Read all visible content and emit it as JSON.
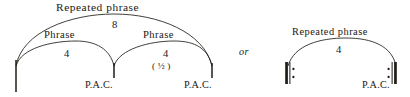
{
  "figure": {
    "kind": "music-phrase-structure-diagram",
    "separator": "or",
    "ink_color": "#201d16",
    "background_color": "#ffffff"
  },
  "diagram_a": {
    "top_bracket": {
      "label": "Repeated phrase",
      "measure_count": "8"
    },
    "phrases": [
      {
        "label": "Phrase",
        "measure_count": "4",
        "cadence": "P.A.C.",
        "annotation": ""
      },
      {
        "label": "Phrase",
        "measure_count": "4",
        "cadence": "P.A.C.",
        "annotation": "( ½ )"
      }
    ]
  },
  "diagram_b": {
    "top_bracket": {
      "label": "Repeated phrase",
      "measure_count": "4"
    },
    "cadence": "P.A.C.",
    "repeat_start": "repeat-begin-sign",
    "repeat_end": "repeat-end-sign"
  }
}
